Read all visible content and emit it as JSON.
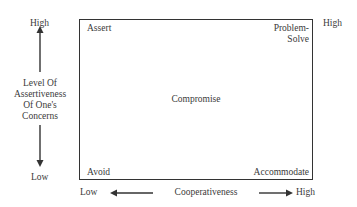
{
  "diagram": {
    "y_axis": {
      "high_label": "High",
      "low_label": "Low",
      "title_lines": [
        "Level Of",
        "Assertiveness",
        "Of One's",
        "Concerns"
      ]
    },
    "x_axis": {
      "low_label": "Low",
      "high_label": "High",
      "title": "Cooperativeness"
    },
    "top_right_outer_label": "High",
    "quadrants": {
      "top_left": "Assert",
      "top_right_lines": [
        "Problem-",
        "Solve"
      ],
      "center": "Compromise",
      "bottom_left": "Avoid",
      "bottom_right": "Accommodate"
    },
    "colors": {
      "line": "#333333",
      "text": "#3a3a3a"
    }
  }
}
